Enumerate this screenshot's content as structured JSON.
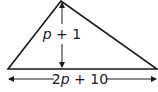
{
  "diagram": {
    "shape": "triangle",
    "height_label": {
      "var": "p",
      "rest": " + 1"
    },
    "base_label": {
      "pre": "2",
      "var": "p",
      "rest": " + 10"
    },
    "colors": {
      "stroke": "#1a1a1a",
      "background": "#ffffff"
    }
  }
}
